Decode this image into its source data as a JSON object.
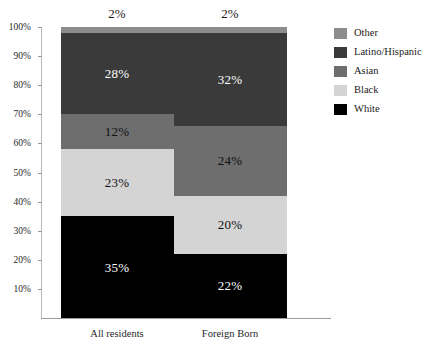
{
  "chart_data": {
    "type": "bar",
    "stacked": true,
    "orientation": "vertical",
    "title": "",
    "subtitle": "",
    "xlabel": "",
    "ylabel": "",
    "categories": [
      "All residents",
      "Foreign Born"
    ],
    "series": [
      {
        "name": "White",
        "color": "#000000",
        "label_color": "light",
        "values": [
          35,
          22
        ]
      },
      {
        "name": "Black",
        "color": "#d4d4d4",
        "label_color": "dark",
        "values": [
          23,
          20
        ]
      },
      {
        "name": "Asian",
        "color": "#6e6e6e",
        "label_color": "dark",
        "values": [
          12,
          24
        ]
      },
      {
        "name": "Latino/Hispanic",
        "color": "#3a3a3a",
        "label_color": "light",
        "values": [
          28,
          32
        ]
      },
      {
        "name": "Other",
        "color": "#8c8c8c",
        "label_color": "dark",
        "values": [
          2,
          2
        ]
      }
    ],
    "stack_order_top_to_bottom": [
      "Other",
      "Latino/Hispanic",
      "Asian",
      "Black",
      "White"
    ],
    "data_labels": {
      "All residents": {
        "Other": "2%",
        "Latino/Hispanic": "28%",
        "Asian": "12%",
        "Black": "23%",
        "White": "35%"
      },
      "Foreign Born": {
        "Other": "2%",
        "Latino/Hispanic": "32%",
        "Asian": "24%",
        "Black": "20%",
        "White": "22%"
      }
    },
    "labels_outside": [
      "Other"
    ],
    "ylim": [
      0,
      100
    ],
    "y_tick_values": [
      10,
      20,
      30,
      40,
      50,
      60,
      70,
      80,
      90,
      100
    ],
    "y_tick_labels": [
      "10%",
      "20%",
      "30%",
      "40%",
      "50%",
      "60%",
      "70%",
      "80%",
      "90%",
      "100%"
    ],
    "grid": false,
    "legend_position": "right",
    "legend_entries": [
      {
        "label": "Other",
        "color": "#8c8c8c"
      },
      {
        "label": "Latino/Hispanic",
        "color": "#3a3a3a"
      },
      {
        "label": "Asian",
        "color": "#6e6e6e"
      },
      {
        "label": "Black",
        "color": "#d4d4d4"
      },
      {
        "label": "White",
        "color": "#000000"
      }
    ]
  },
  "axis": {
    "y_ticks": [
      {
        "label": "100%",
        "value": 100
      },
      {
        "label": "90%",
        "value": 90
      },
      {
        "label": "80%",
        "value": 80
      },
      {
        "label": "70%",
        "value": 70
      },
      {
        "label": "60%",
        "value": 60
      },
      {
        "label": "50%",
        "value": 50
      },
      {
        "label": "40%",
        "value": 40
      },
      {
        "label": "30%",
        "value": 30
      },
      {
        "label": "20%",
        "value": 20
      },
      {
        "label": "10%",
        "value": 10
      }
    ],
    "x_categories": [
      {
        "label": "All residents"
      },
      {
        "label": "Foreign Born"
      }
    ]
  }
}
